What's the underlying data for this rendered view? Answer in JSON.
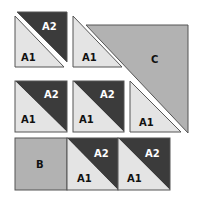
{
  "diagram": {
    "colors": {
      "background": "#ffffff",
      "dark": "#3b3b3b",
      "light": "#e4e4e4",
      "medium": "#b2b2b2",
      "outline": "#555555",
      "label_dark": "#111111",
      "label_light": "#ffffff"
    },
    "labels": {
      "a1": "A1",
      "a2": "A2",
      "b": "B",
      "c": "C"
    },
    "pieces": [
      {
        "id": "r1c1-a2",
        "label": "A2",
        "shape": "triangle",
        "fill": "dark"
      },
      {
        "id": "r1c1-a1",
        "label": "A1",
        "shape": "triangle",
        "fill": "light"
      },
      {
        "id": "r1c2-a1",
        "label": "A1",
        "shape": "triangle",
        "fill": "light"
      },
      {
        "id": "c",
        "label": "C",
        "shape": "large-triangle",
        "fill": "medium"
      },
      {
        "id": "r2c1-a2",
        "label": "A2",
        "shape": "triangle",
        "fill": "dark"
      },
      {
        "id": "r2c1-a1",
        "label": "A1",
        "shape": "triangle",
        "fill": "light"
      },
      {
        "id": "r2c2-a2",
        "label": "A2",
        "shape": "triangle",
        "fill": "dark"
      },
      {
        "id": "r2c2-a1",
        "label": "A1",
        "shape": "triangle",
        "fill": "light"
      },
      {
        "id": "r2c3-a1",
        "label": "A1",
        "shape": "triangle",
        "fill": "light"
      },
      {
        "id": "b",
        "label": "B",
        "shape": "square",
        "fill": "medium"
      },
      {
        "id": "r3c2-a2",
        "label": "A2",
        "shape": "triangle",
        "fill": "dark"
      },
      {
        "id": "r3c2-a1",
        "label": "A1",
        "shape": "triangle",
        "fill": "light"
      },
      {
        "id": "r3c3-a2",
        "label": "A2",
        "shape": "triangle",
        "fill": "dark"
      },
      {
        "id": "r3c3-a1",
        "label": "A1",
        "shape": "triangle",
        "fill": "light"
      }
    ]
  }
}
